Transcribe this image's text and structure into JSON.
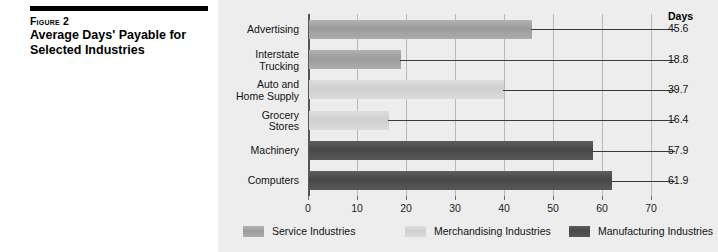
{
  "caption": {
    "figure_label": "Figure 2",
    "title_line1": "Average Days' Payable for",
    "title_line2": "Selected Industries"
  },
  "chart_data": {
    "type": "bar",
    "orientation": "horizontal",
    "title": "Average Days' Payable for Selected Industries",
    "xlabel": "",
    "ylabel": "",
    "xlim": [
      0,
      70
    ],
    "xticks": [
      0,
      10,
      20,
      30,
      40,
      50,
      60,
      70
    ],
    "grid": true,
    "value_column_header": "Days",
    "categories": [
      "Advertising",
      "Interstate Trucking",
      "Auto and Home Supply",
      "Grocery Stores",
      "Machinery",
      "Computers"
    ],
    "values": [
      45.6,
      18.8,
      39.7,
      16.4,
      57.9,
      61.9
    ],
    "bars": [
      {
        "label_line1": "Advertising",
        "label_line2": "",
        "value": 45.6,
        "group": "service"
      },
      {
        "label_line1": "Interstate",
        "label_line2": "Trucking",
        "value": 18.8,
        "group": "service"
      },
      {
        "label_line1": "Auto and",
        "label_line2": "Home Supply",
        "value": 39.7,
        "group": "merch"
      },
      {
        "label_line1": "Grocery",
        "label_line2": "Stores",
        "value": 16.4,
        "group": "merch"
      },
      {
        "label_line1": "Machinery",
        "label_line2": "",
        "value": 57.9,
        "group": "manuf"
      },
      {
        "label_line1": "Computers",
        "label_line2": "",
        "value": 61.9,
        "group": "manuf"
      }
    ],
    "legend_position": "bottom",
    "legend": [
      {
        "label": "Service Industries",
        "group": "service",
        "color": "#9b9b9b"
      },
      {
        "label": "Merchandising Industries",
        "group": "merch",
        "color": "#cfcfcf"
      },
      {
        "label": "Manufacturing Industries",
        "group": "manuf",
        "color": "#474747"
      }
    ]
  },
  "colors": {
    "panel_background": "#ededed",
    "page_background": "#ffffff",
    "rule": "#000000",
    "gridline": "#b9b9b9",
    "axis": "#555555"
  }
}
